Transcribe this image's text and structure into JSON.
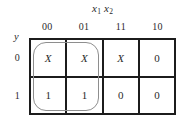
{
  "figure": {
    "name": "karnaugh-map",
    "background_color": "#ffffff",
    "line_color": "#1c1c1c",
    "group_color": "#8e8e8e"
  },
  "column_variables": {
    "label_plain": "x1x2",
    "var1_base": "x",
    "var1_sub": "1",
    "var2_base": "x",
    "var2_sub": "2"
  },
  "row_variable": {
    "label": "y"
  },
  "column_headers": [
    "00",
    "01",
    "11",
    "10"
  ],
  "row_headers": [
    "0",
    "1"
  ],
  "chart_data": {
    "type": "table",
    "title": "",
    "xlabel": "x1x2",
    "ylabel": "y",
    "categories": [
      "00",
      "01",
      "11",
      "10"
    ],
    "row_categories": [
      "0",
      "1"
    ],
    "cells": [
      [
        "X",
        "X",
        "X",
        "0"
      ],
      [
        "1",
        "1",
        "0",
        "0"
      ]
    ],
    "groups": [
      {
        "name": "prime-implicant-loop",
        "cells": [
          "r0c0",
          "r0c1",
          "r1c0",
          "r1c1"
        ],
        "row_start": 0,
        "row_span": 2,
        "col_start": 0,
        "col_span": 2
      }
    ],
    "legend": [],
    "grid": true
  }
}
